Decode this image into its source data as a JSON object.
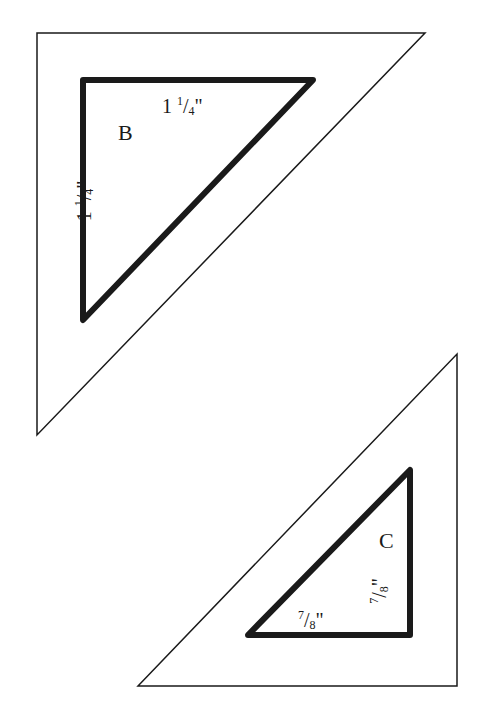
{
  "pieces": [
    {
      "id": "B",
      "label": "B",
      "top_edge": {
        "whole": "1",
        "num": "1",
        "den": "4",
        "unit": "\""
      },
      "left_edge": {
        "whole": "1",
        "num": "1",
        "den": "4",
        "unit": "\""
      }
    },
    {
      "id": "C",
      "label": "C",
      "bottom_edge": {
        "whole": "",
        "num": "7",
        "den": "8",
        "unit": "\""
      },
      "right_edge": {
        "whole": "",
        "num": "7",
        "den": "8",
        "unit": "\""
      }
    }
  ],
  "colors": {
    "outline": "#1a1a1a",
    "background": "#ffffff"
  }
}
